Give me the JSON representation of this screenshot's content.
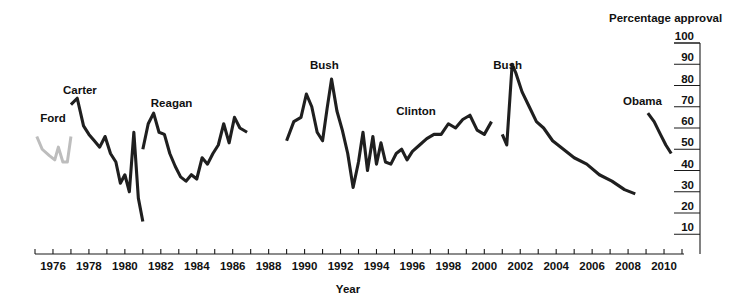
{
  "chart_data": {
    "type": "line",
    "title": "",
    "xlabel": "Year",
    "ylabel": "Percentage approval",
    "xlim": [
      1975,
      2011
    ],
    "ylim": [
      0,
      100
    ],
    "grid": false,
    "legend": "inline-annotations",
    "x_ticks": [
      1975,
      1976,
      1977,
      1978,
      1979,
      1980,
      1981,
      1982,
      1983,
      1984,
      1985,
      1986,
      1987,
      1988,
      1989,
      1990,
      1991,
      1992,
      1993,
      1994,
      1995,
      1996,
      1997,
      1998,
      1999,
      2000,
      2001,
      2002,
      2003,
      2004,
      2005,
      2006,
      2007,
      2008,
      2009,
      2010,
      2011
    ],
    "x_tick_labels": [
      "1976",
      "1978",
      "1980",
      "1982",
      "1984",
      "1986",
      "1988",
      "1990",
      "1992",
      "1994",
      "1996",
      "1998",
      "2000",
      "2002",
      "2004",
      "2006",
      "2008",
      "2010"
    ],
    "y_ticks": [
      10,
      20,
      30,
      40,
      50,
      60,
      70,
      80,
      90,
      100
    ],
    "y_tick_labels": [
      "10",
      "20",
      "30",
      "40",
      "50",
      "60",
      "70",
      "80",
      "90",
      "100"
    ],
    "series": [
      {
        "name": "Ford",
        "color": "#bdbdbd",
        "label_x": 1976.0,
        "label_y": 63,
        "x": [
          1975.1,
          1975.4,
          1975.8,
          1976.1,
          1976.3,
          1976.55,
          1976.8,
          1977.0
        ],
        "values": [
          56,
          50,
          47,
          45,
          51,
          44,
          44,
          56
        ]
      },
      {
        "name": "Carter",
        "color": "#1f1f1f",
        "label_x": 1977.5,
        "label_y": 76,
        "x": [
          1977.0,
          1977.35,
          1977.7,
          1978.0,
          1978.3,
          1978.6,
          1978.9,
          1979.2,
          1979.5,
          1979.75,
          1980.0,
          1980.25,
          1980.5,
          1980.75,
          1981.0
        ],
        "values": [
          71,
          74,
          61,
          57,
          54,
          51,
          56,
          48,
          44,
          34,
          38,
          30,
          58,
          27,
          16
        ]
      },
      {
        "name": "Reagan",
        "color": "#1f1f1f",
        "label_x": 1982.6,
        "label_y": 70,
        "x": [
          1981.0,
          1981.3,
          1981.6,
          1981.9,
          1982.2,
          1982.5,
          1982.8,
          1983.1,
          1983.4,
          1983.7,
          1984.0,
          1984.3,
          1984.6,
          1984.9,
          1985.2,
          1985.5,
          1985.8,
          1986.1,
          1986.4,
          1986.8
        ],
        "values": [
          50,
          62,
          67,
          58,
          57,
          48,
          42,
          37,
          35,
          38,
          36,
          46,
          43,
          48,
          52,
          62,
          53,
          65,
          60,
          58
        ]
      },
      {
        "name": "Bush",
        "color": "#1f1f1f",
        "label_x": 1991.1,
        "label_y": 88,
        "x": [
          1989.0,
          1989.4,
          1989.8,
          1990.1,
          1990.4,
          1990.7,
          1991.0,
          1991.25,
          1991.5,
          1991.8,
          1992.1,
          1992.4,
          1992.7,
          1993.0
        ],
        "values": [
          54,
          63,
          65,
          76,
          70,
          58,
          54,
          69,
          83,
          68,
          59,
          48,
          32,
          44
        ]
      },
      {
        "name": "Clinton",
        "color": "#1f1f1f",
        "label_x": 1996.2,
        "label_y": 66,
        "x": [
          1993.0,
          1993.25,
          1993.5,
          1993.8,
          1994.0,
          1994.25,
          1994.5,
          1994.8,
          1995.1,
          1995.4,
          1995.7,
          1996.0,
          1996.4,
          1996.8,
          1997.2,
          1997.6,
          1998.0,
          1998.4,
          1998.8,
          1999.2,
          1999.6,
          2000.0,
          2000.4
        ],
        "values": [
          44,
          58,
          40,
          56,
          43,
          53,
          44,
          43,
          48,
          50,
          45,
          49,
          52,
          55,
          57,
          57,
          62,
          60,
          64,
          66,
          59,
          57,
          63
        ]
      },
      {
        "name": "Bush",
        "color": "#1f1f1f",
        "label_x": 2001.3,
        "label_y": 88,
        "x": [
          2001.0,
          2001.25,
          2001.55,
          2001.75,
          2002.1,
          2002.5,
          2002.9,
          2003.3,
          2003.8,
          2004.4,
          2005.0,
          2005.7,
          2006.4,
          2007.1,
          2007.8,
          2008.4
        ],
        "values": [
          57,
          52,
          90,
          86,
          77,
          70,
          63,
          60,
          54,
          50,
          46,
          43,
          38,
          35,
          31,
          29
        ]
      },
      {
        "name": "Obama",
        "color": "#1f1f1f",
        "label_x": 2008.8,
        "label_y": 71,
        "x": [
          2009.1,
          2009.45,
          2009.8,
          2010.1,
          2010.4
        ],
        "values": [
          67,
          63,
          57,
          52,
          48
        ]
      }
    ]
  }
}
